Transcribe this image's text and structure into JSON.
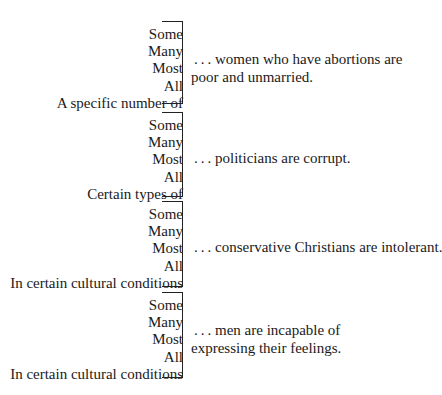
{
  "blocks": [
    {
      "quantifiers": [
        "Some",
        "Many",
        "Most",
        "All",
        "A specific number of"
      ],
      "statement_lines": [
        " . . . women who have abortions are",
        "poor and unmarried."
      ]
    },
    {
      "quantifiers": [
        "Some",
        "Many",
        "Most",
        "All",
        "Certain types of"
      ],
      "statement_lines": [
        " . . . politicians are corrupt."
      ]
    },
    {
      "quantifiers": [
        "Some",
        "Many",
        "Most",
        "All",
        "In certain cultural conditions"
      ],
      "statement_lines": [
        " . . . conservative Christians are intolerant."
      ]
    },
    {
      "quantifiers": [
        "Some",
        "Many",
        "Most",
        "All",
        "In certain cultural conditions"
      ],
      "statement_lines": [
        " . . . men are incapable of",
        "expressing their feelings."
      ]
    }
  ]
}
